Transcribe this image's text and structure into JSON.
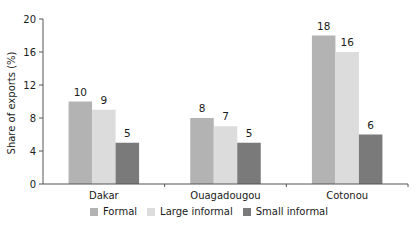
{
  "chart_data": {
    "type": "bar",
    "title": "",
    "xlabel": "",
    "ylabel": "Share of exports (%)",
    "ylim": [
      0,
      20
    ],
    "yticks": [
      0,
      4,
      8,
      12,
      16,
      20
    ],
    "grid": false,
    "legend_position": "bottom",
    "categories": [
      "Dakar",
      "Ouagadougou",
      "Cotonou"
    ],
    "series": [
      {
        "name": "Formal",
        "color": "#b3b3b3",
        "values": [
          10,
          8,
          18
        ]
      },
      {
        "name": "Large informal",
        "color": "#dcdcdc",
        "values": [
          9,
          7,
          16
        ]
      },
      {
        "name": "Small informal",
        "color": "#7a7a7a",
        "values": [
          5,
          5,
          6
        ]
      }
    ]
  }
}
